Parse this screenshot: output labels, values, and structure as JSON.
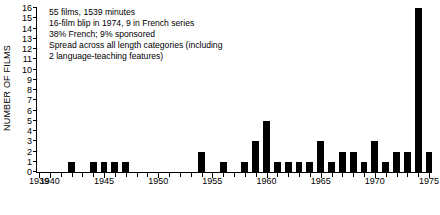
{
  "chart_data": {
    "type": "bar",
    "title": "",
    "subtitle": "",
    "xlabel": "",
    "ylabel": "NUMBER OF FILMS",
    "xlim": [
      1939,
      1975
    ],
    "ylim": [
      0,
      16
    ],
    "grid": false,
    "legend": null,
    "bar_color": "#000000",
    "categories": [
      1939,
      1940,
      1941,
      1942,
      1943,
      1944,
      1945,
      1946,
      1947,
      1948,
      1949,
      1950,
      1951,
      1952,
      1953,
      1954,
      1955,
      1956,
      1957,
      1958,
      1959,
      1960,
      1961,
      1962,
      1963,
      1964,
      1965,
      1966,
      1967,
      1968,
      1969,
      1970,
      1971,
      1972,
      1973,
      1974,
      1975
    ],
    "values": [
      0,
      0,
      0,
      1,
      0,
      1,
      1,
      1,
      1,
      0,
      0,
      0,
      0,
      0,
      0,
      2,
      0,
      1,
      0,
      1,
      3,
      5,
      1,
      1,
      1,
      1,
      3,
      1,
      2,
      2,
      1,
      3,
      1,
      2,
      2,
      16,
      2
    ],
    "ytick_labels": [
      "16",
      "15",
      "14",
      "13",
      "12",
      "11",
      "10",
      "9",
      "8",
      "7",
      "6",
      "5",
      "4",
      "3",
      "2",
      "1",
      "0"
    ],
    "ytick_values": [
      16,
      15,
      14,
      13,
      12,
      11,
      10,
      9,
      8,
      7,
      6,
      5,
      4,
      3,
      2,
      1,
      0
    ],
    "xtick_labels": [
      "1939",
      "1940",
      "1945",
      "1950",
      "1955",
      "1960",
      "1965",
      "1970",
      "1975"
    ],
    "xtick_values": [
      1939,
      1940,
      1945,
      1950,
      1955,
      1960,
      1965,
      1970,
      1975
    ],
    "annotations": [
      "55 films, 1539 minutes",
      "16-film blip in 1974, 9 in French series",
      "38% French; 9% sponsored",
      "Spread across all length categories (including",
      "2 language-teaching features)"
    ]
  }
}
